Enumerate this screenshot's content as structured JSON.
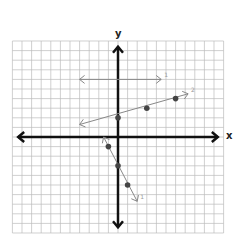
{
  "axes": {
    "x_label": "x",
    "y_label": "y",
    "x_range": [
      -11,
      11
    ],
    "y_range": [
      -10,
      10
    ],
    "grid": true
  },
  "lines": [
    {
      "label": "1",
      "description": "horizontal line",
      "from": [
        -4,
        6
      ],
      "to": [
        4.5,
        6
      ],
      "points": [],
      "color": "#888888"
    },
    {
      "label": "2",
      "description": "increasing line",
      "from": [
        -4,
        1.3
      ],
      "to": [
        7.3,
        4.5
      ],
      "points": [
        [
          0,
          2
        ],
        [
          3,
          3
        ],
        [
          6,
          4
        ]
      ],
      "color": "#888888"
    },
    {
      "label": "1",
      "description": "decreasing line",
      "from": [
        -1.5,
        0
      ],
      "to": [
        2,
        -6.7
      ],
      "points": [
        [
          -1,
          -1
        ],
        [
          0,
          -3
        ],
        [
          1,
          -5
        ]
      ],
      "color": "#888888"
    }
  ],
  "colors": {
    "grid": "#bbbbbb",
    "axis": "#111111",
    "line": "#888888",
    "point": "#444444"
  }
}
